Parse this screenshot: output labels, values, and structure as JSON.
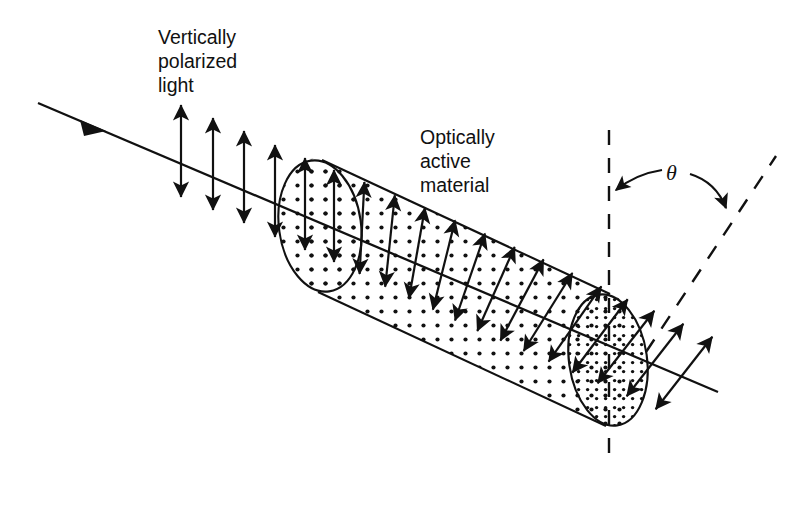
{
  "figure": {
    "background_color": "#ffffff",
    "ink_color": "#111111",
    "width": 809,
    "height": 509
  },
  "labels": {
    "incoming_light": {
      "line1": "Vertically",
      "line2": "polarized",
      "line3": "light",
      "x": 158,
      "y": 44
    },
    "material": {
      "line1": "Optically",
      "line2": "active",
      "line3": "material",
      "x": 420,
      "y": 144
    },
    "angle_symbol": {
      "text": "θ",
      "x": 672,
      "y": 172
    }
  },
  "beam": {
    "name": "light-beam-axis",
    "start_x": 38,
    "start_y": 103,
    "end_x": 718,
    "end_y": 392,
    "direction_marker_x": 95,
    "direction_marker_y": 127
  },
  "cylinder": {
    "name": "optically-active-cylinder",
    "left_face": {
      "cx": 320,
      "cy": 226,
      "rx": 41,
      "ry": 66,
      "rotation": -8
    },
    "right_face": {
      "cx": 608,
      "cy": 360,
      "rx": 39,
      "ry": 66,
      "rotation": -8
    },
    "top_edge": {
      "x1": 322,
      "y1": 160,
      "x2": 610,
      "y2": 294
    },
    "bottom_edge": {
      "x1": 318,
      "y1": 292,
      "x2": 606,
      "y2": 426
    },
    "fill_pattern": "dotted-stipple",
    "right_face_pattern": "dense-dotted-stipple"
  },
  "reference_lines": {
    "vertical_dashed": {
      "name": "vertical-reference-line",
      "x1": 609,
      "y1": 130,
      "x2": 609,
      "y2": 456,
      "style": "dashed"
    },
    "rotated_dashed": {
      "name": "rotated-polarization-line",
      "x1": 646,
      "y1": 352,
      "x2": 776,
      "y2": 156,
      "style": "dashed"
    }
  },
  "angle_arcs": [
    {
      "name": "theta-arrow-to-vertical",
      "from_x": 662,
      "from_y": 172,
      "to_x": 614,
      "to_y": 193
    },
    {
      "name": "theta-arrow-to-rotated",
      "from_x": 688,
      "from_y": 174,
      "to_x": 727,
      "to_y": 212
    }
  ],
  "polarization_arrows": {
    "description": "Double-headed arrows showing the plane of polarization; vertical before the sample, progressively rotated inside it, fixed tilt after exit.",
    "half_length": 46,
    "entering": [
      {
        "cx": 181,
        "cy": 151,
        "angle_deg": 0
      },
      {
        "cx": 213,
        "cy": 164,
        "angle_deg": 0
      },
      {
        "cx": 244,
        "cy": 177,
        "angle_deg": 0
      },
      {
        "cx": 275,
        "cy": 191,
        "angle_deg": 0
      },
      {
        "cx": 305,
        "cy": 204,
        "angle_deg": 0
      }
    ],
    "inside": [
      {
        "cx": 334,
        "cy": 216,
        "angle_deg": 0
      },
      {
        "cx": 362,
        "cy": 228,
        "angle_deg": 3
      },
      {
        "cx": 390,
        "cy": 241,
        "angle_deg": 6
      },
      {
        "cx": 417,
        "cy": 253,
        "angle_deg": 10
      },
      {
        "cx": 444,
        "cy": 265,
        "angle_deg": 14
      },
      {
        "cx": 470,
        "cy": 277,
        "angle_deg": 19
      },
      {
        "cx": 496,
        "cy": 289,
        "angle_deg": 24
      },
      {
        "cx": 522,
        "cy": 300,
        "angle_deg": 28
      },
      {
        "cx": 548,
        "cy": 312,
        "angle_deg": 32
      },
      {
        "cx": 575,
        "cy": 324,
        "angle_deg": 35
      },
      {
        "cx": 600,
        "cy": 336,
        "angle_deg": 37
      }
    ],
    "exiting": [
      {
        "cx": 626,
        "cy": 347,
        "angle_deg": 38
      },
      {
        "cx": 655,
        "cy": 360,
        "angle_deg": 38
      },
      {
        "cx": 684,
        "cy": 373,
        "angle_deg": 38
      }
    ]
  }
}
